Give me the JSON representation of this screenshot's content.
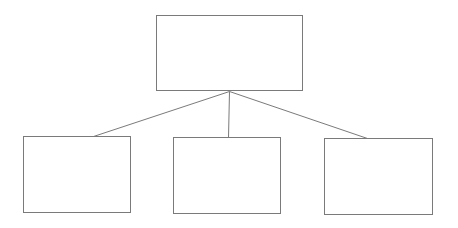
{
  "diagram": {
    "type": "hierarchy",
    "colors": {
      "background": "#ffffff",
      "border": "#7a7a7a",
      "line": "#7a7a7a"
    },
    "root": {
      "label": "",
      "box": {
        "x": 156,
        "y": 15,
        "w": 147,
        "h": 76
      }
    },
    "children": [
      {
        "label": "",
        "box": {
          "x": 23,
          "y": 136,
          "w": 108,
          "h": 77
        }
      },
      {
        "label": "",
        "box": {
          "x": 173,
          "y": 137,
          "w": 108,
          "h": 77
        }
      },
      {
        "label": "",
        "box": {
          "x": 324,
          "y": 138,
          "w": 109,
          "h": 77
        }
      }
    ],
    "edges": [
      {
        "from": [
          229,
          91
        ],
        "to": [
          90,
          137
        ]
      },
      {
        "from": [
          229,
          91
        ],
        "to": [
          228,
          137
        ]
      },
      {
        "from": [
          229,
          91
        ],
        "to": [
          367,
          138
        ]
      }
    ]
  }
}
